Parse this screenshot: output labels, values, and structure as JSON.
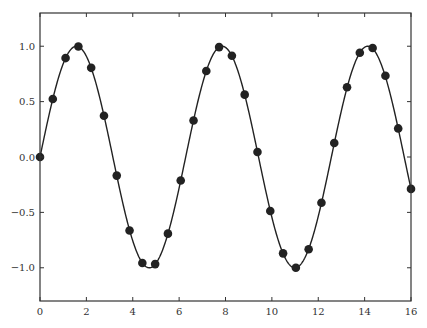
{
  "chart_data": {
    "type": "line",
    "title": "",
    "xlabel": "",
    "ylabel": "",
    "xlim": [
      0,
      16
    ],
    "ylim": [
      -1.3,
      1.3
    ],
    "grid": false,
    "legend": null,
    "xticks": [
      0,
      2,
      4,
      6,
      8,
      10,
      12,
      14,
      16
    ],
    "xtick_labels": [
      "0",
      "2",
      "4",
      "6",
      "8",
      "10",
      "12",
      "14",
      "16"
    ],
    "yticks": [
      -1.0,
      -0.5,
      0.0,
      0.5,
      1.0
    ],
    "ytick_labels": [
      "−1.0",
      "−0.5",
      "0.0",
      "0.5",
      "1.0"
    ],
    "series": [
      {
        "name": "sin(x) curve",
        "style": "line",
        "color": "#222222",
        "function": "sin(x)",
        "x_range": [
          0,
          16
        ]
      },
      {
        "name": "sin(x) samples",
        "style": "markers",
        "color": "#222222",
        "x": [
          0.0,
          0.552,
          1.103,
          1.655,
          2.207,
          2.759,
          3.31,
          3.862,
          4.414,
          4.966,
          5.517,
          6.069,
          6.621,
          7.172,
          7.724,
          8.276,
          8.828,
          9.379,
          9.931,
          10.483,
          11.034,
          11.586,
          12.138,
          12.69,
          13.241,
          13.793,
          14.345,
          14.897,
          15.448,
          16.0
        ],
        "y": [
          0.0,
          0.524,
          0.893,
          0.997,
          0.805,
          0.373,
          -0.168,
          -0.663,
          -0.957,
          -0.967,
          -0.692,
          -0.212,
          0.33,
          0.777,
          0.992,
          0.914,
          0.563,
          0.045,
          -0.487,
          -0.87,
          -1.0,
          -0.833,
          -0.413,
          0.126,
          0.63,
          0.941,
          0.984,
          0.733,
          0.258,
          -0.288
        ]
      }
    ]
  }
}
